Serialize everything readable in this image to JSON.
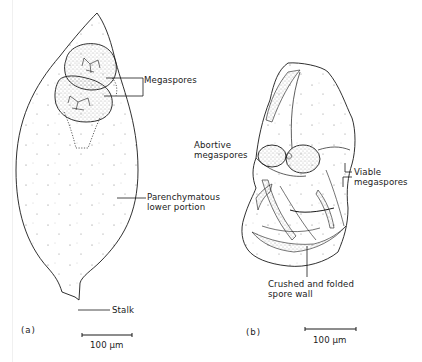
{
  "figure": {
    "panel_a": {
      "panel_label": "(a)",
      "labels": {
        "megaspores": "Megaspores",
        "parenchymatous_line1": "Parenchymatous",
        "parenchymatous_line2": "lower portion",
        "stalk": "Stalk"
      },
      "scale_bar": {
        "value": "100 μm"
      }
    },
    "panel_b": {
      "panel_label": "(b)",
      "labels": {
        "abortive_line1": "Abortive",
        "abortive_line2": "megaspores",
        "viable_line1": "Viable",
        "viable_line2": "megaspores",
        "crushed_line1": "Crushed and folded",
        "crushed_line2": "spore  wall"
      },
      "scale_bar": {
        "value": "100 μm"
      }
    },
    "colors": {
      "ink": "#1a1a1a",
      "stipple": "#6a6a6a",
      "background": "#ffffff"
    }
  }
}
